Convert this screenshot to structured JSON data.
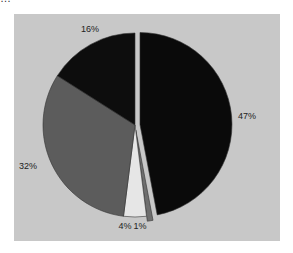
{
  "chart_data": {
    "type": "pie",
    "title": "",
    "categories": [
      "A",
      "B",
      "C",
      "D",
      "E"
    ],
    "values": [
      47,
      1,
      4,
      32,
      16
    ],
    "labels": [
      "47%",
      "1%",
      "4%",
      "32%",
      "16%"
    ],
    "colors": [
      "#0a0a0a",
      "#6e6e6e",
      "#e6e6e6",
      "#5c5c5c",
      "#0d0d0d"
    ],
    "start_angle_deg": 0,
    "direction": "clockwise",
    "exploded": [
      true,
      true,
      false,
      false,
      false
    ],
    "legend": "none",
    "background": "#c8c8c8"
  },
  "header": {
    "cropped_text": "…"
  }
}
